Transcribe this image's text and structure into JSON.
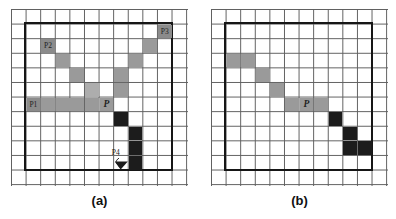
{
  "figure": {
    "background": "#ffffff",
    "colors": {
      "grid_line": "#5f5f5f",
      "bold_border": "#161616",
      "gray": "#9a9a9a",
      "gray_light": "#adadad",
      "gray_dark": "#8b8b8b",
      "black": "#1c1c1c",
      "label_text": "#222222"
    },
    "grid": {
      "cols": 12,
      "rows": 12,
      "cell": 14.6,
      "bold_region": {
        "c0": 1,
        "r0": 1,
        "cols": 10,
        "rows": 10
      }
    },
    "panels": [
      {
        "caption": "(a)",
        "cells": [
          {
            "c": 2,
            "r": 2,
            "tone": "gray_dark",
            "label": "P2"
          },
          {
            "c": 3,
            "r": 3,
            "tone": "gray"
          },
          {
            "c": 4,
            "r": 4,
            "tone": "gray"
          },
          {
            "c": 5,
            "r": 5,
            "tone": "gray_light"
          },
          {
            "c": 10,
            "r": 1,
            "tone": "gray_dark",
            "label": "P3"
          },
          {
            "c": 9,
            "r": 2,
            "tone": "gray"
          },
          {
            "c": 8,
            "r": 3,
            "tone": "gray"
          },
          {
            "c": 7,
            "r": 4,
            "tone": "gray"
          },
          {
            "c": 7,
            "r": 5,
            "tone": "gray"
          },
          {
            "c": 1,
            "r": 6,
            "tone": "gray_dark",
            "label": "P1"
          },
          {
            "c": 2,
            "r": 6,
            "tone": "gray"
          },
          {
            "c": 3,
            "r": 6,
            "tone": "gray"
          },
          {
            "c": 4,
            "r": 6,
            "tone": "gray"
          },
          {
            "c": 5,
            "r": 6,
            "tone": "gray"
          },
          {
            "c": 6,
            "r": 6,
            "tone": "gray",
            "label": "P",
            "italic": true
          },
          {
            "c": 7,
            "r": 7,
            "tone": "black"
          },
          {
            "c": 8,
            "r": 8,
            "tone": "black"
          },
          {
            "c": 8,
            "r": 9,
            "tone": "black"
          },
          {
            "c": 8,
            "r": 10,
            "tone": "black"
          }
        ],
        "marker": {
          "label": "P4",
          "cell_c": 7,
          "cell_r": 10
        }
      },
      {
        "caption": "(b)",
        "cells": [
          {
            "c": 1,
            "r": 3,
            "tone": "gray"
          },
          {
            "c": 2,
            "r": 3,
            "tone": "gray"
          },
          {
            "c": 3,
            "r": 4,
            "tone": "gray"
          },
          {
            "c": 4,
            "r": 5,
            "tone": "gray"
          },
          {
            "c": 5,
            "r": 6,
            "tone": "gray"
          },
          {
            "c": 6,
            "r": 6,
            "tone": "gray",
            "label": "P",
            "italic": true
          },
          {
            "c": 7,
            "r": 6,
            "tone": "gray"
          },
          {
            "c": 8,
            "r": 7,
            "tone": "black"
          },
          {
            "c": 9,
            "r": 8,
            "tone": "black"
          },
          {
            "c": 9,
            "r": 9,
            "tone": "black"
          },
          {
            "c": 10,
            "r": 9,
            "tone": "black"
          }
        ]
      }
    ]
  }
}
